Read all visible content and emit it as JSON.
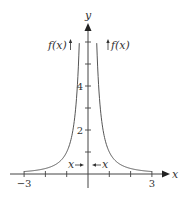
{
  "chart_data": {
    "type": "line",
    "title": "",
    "function": "f(x) = 1/x^2",
    "xlabel": "x",
    "ylabel": "y",
    "xlim": [
      -3,
      3
    ],
    "ylim": [
      0,
      6
    ],
    "x_ticks": [
      -3,
      -2,
      -1,
      1,
      2,
      3
    ],
    "x_tick_labels": [
      {
        "value": -3,
        "label": "−3"
      },
      {
        "value": 3,
        "label": "3"
      }
    ],
    "y_ticks": [
      1,
      2,
      3,
      4,
      5,
      6
    ],
    "y_tick_labels": [
      {
        "value": 2,
        "label": "2"
      },
      {
        "value": 4,
        "label": "4"
      }
    ],
    "grid": false,
    "series": [
      {
        "name": "left branch",
        "x_range": [
          -3,
          -0.41
        ]
      },
      {
        "name": "right branch",
        "x_range": [
          0.41,
          3
        ]
      }
    ],
    "annotations": {
      "left_top": "f(x)",
      "right_top": "f(x)",
      "left_bottom": "x",
      "right_bottom": "x"
    }
  }
}
